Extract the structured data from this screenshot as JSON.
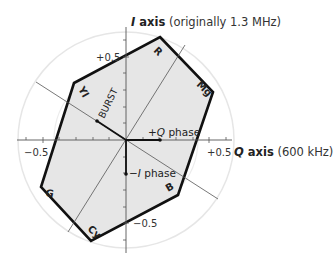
{
  "diagram": {
    "i_axis": {
      "letter": "I",
      "word": " axis",
      "note": " (originally 1.3 MHz)"
    },
    "q_axis": {
      "letter": "Q",
      "word": " axis",
      "note": " (600 kHz)"
    },
    "ticks": {
      "i_pos": "+0.5",
      "i_neg": "−0.5",
      "q_pos": "+0.5",
      "q_neg": "−0.5"
    },
    "phases": {
      "burst": "BURST",
      "plus_q_sign": "+",
      "plus_q_letter": "Q",
      "plus_q_word": " phase",
      "minus_i_sign": "−",
      "minus_i_letter": "I",
      "minus_i_word": " phase"
    },
    "vertices": [
      {
        "label": "R",
        "name": "red"
      },
      {
        "label": "Mg",
        "name": "magenta"
      },
      {
        "label": "B",
        "name": "blue"
      },
      {
        "label": "Cy",
        "name": "cyan"
      },
      {
        "label": "G",
        "name": "green"
      },
      {
        "label": "Yl",
        "name": "yellow"
      }
    ],
    "colors": {
      "hexagon_fill": "#e6e6e6",
      "hexagon_stroke": "#111111",
      "circle": "#e8e8e8",
      "axis": "#333333"
    }
  }
}
